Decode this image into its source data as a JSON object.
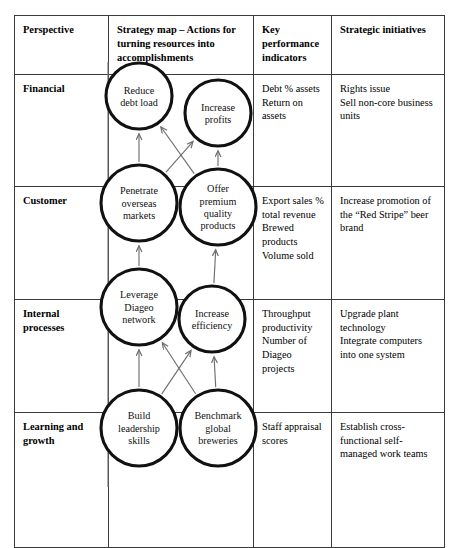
{
  "table": {
    "columns": [
      {
        "id": "perspective",
        "header": "Perspective"
      },
      {
        "id": "strategy_map",
        "header": "Strategy map – Actions for turning resources into accomplishments"
      },
      {
        "id": "kpi",
        "header": "Key performance indicators"
      },
      {
        "id": "initiatives",
        "header": "Strategic initiatives"
      }
    ],
    "rows": [
      {
        "perspective": "Financial",
        "kpi": [
          "Debt % assets",
          "Return on assets"
        ],
        "initiatives": [
          "Rights issue",
          "Sell non-core business units"
        ]
      },
      {
        "perspective": "Customer",
        "kpi": [
          "Export sales % total revenue",
          "Brewed products Volume sold"
        ],
        "initiatives": [
          "Increase promotion of the “Red Stripe” beer brand"
        ]
      },
      {
        "perspective": "Internal processes",
        "kpi": [
          "Throughput productivity",
          "Number of Diageo projects"
        ],
        "initiatives": [
          "Upgrade plant technology",
          "Integrate computers into one system"
        ]
      },
      {
        "perspective": "Learning and growth",
        "kpi": [
          "Staff appraisal scores"
        ],
        "initiatives": [
          "Establish cross-functional self-managed work teams"
        ]
      }
    ]
  },
  "strategy_map": {
    "nodes": [
      {
        "id": "reduce_debt",
        "perspective": "Financial",
        "lines": [
          "Reduce",
          "debt load"
        ],
        "cx": 139,
        "cy": 96,
        "r": 33
      },
      {
        "id": "increase_profits",
        "perspective": "Financial",
        "lines": [
          "Increase",
          "profits"
        ],
        "cx": 218,
        "cy": 113,
        "r": 33
      },
      {
        "id": "penetrate",
        "perspective": "Customer",
        "lines": [
          "Penetrate",
          "overseas",
          "markets"
        ],
        "cx": 139,
        "cy": 203,
        "r": 38
      },
      {
        "id": "offer_premium",
        "perspective": "Customer",
        "lines": [
          "Offer",
          "premium",
          "quality",
          "products"
        ],
        "cx": 218,
        "cy": 207,
        "r": 38
      },
      {
        "id": "leverage",
        "perspective": "Internal processes",
        "lines": [
          "Leverage",
          "Diageo",
          "network"
        ],
        "cx": 139,
        "cy": 307,
        "r": 38
      },
      {
        "id": "efficiency",
        "perspective": "Internal processes",
        "lines": [
          "Increase",
          "efficiency"
        ],
        "cx": 212,
        "cy": 319,
        "r": 33
      },
      {
        "id": "build_leader",
        "perspective": "Learning and growth",
        "lines": [
          "Build",
          "leadership",
          "skills"
        ],
        "cx": 139,
        "cy": 428,
        "r": 38
      },
      {
        "id": "benchmark",
        "perspective": "Learning and growth",
        "lines": [
          "Benchmark",
          "global",
          "breweries"
        ],
        "cx": 218,
        "cy": 428,
        "r": 38
      }
    ],
    "links": [
      {
        "from": "build_leader",
        "to": "leverage"
      },
      {
        "from": "build_leader",
        "to": "efficiency"
      },
      {
        "from": "benchmark",
        "to": "leverage"
      },
      {
        "from": "benchmark",
        "to": "efficiency"
      },
      {
        "from": "leverage",
        "to": "penetrate"
      },
      {
        "from": "efficiency",
        "to": "offer_premium"
      },
      {
        "from": "penetrate",
        "to": "reduce_debt"
      },
      {
        "from": "penetrate",
        "to": "increase_profits"
      },
      {
        "from": "offer_premium",
        "to": "reduce_debt"
      },
      {
        "from": "offer_premium",
        "to": "increase_profits"
      }
    ],
    "spine": {
      "label": "vertical-backbone-line",
      "x": 108,
      "y_top": 62,
      "y_bottom": 487
    }
  }
}
